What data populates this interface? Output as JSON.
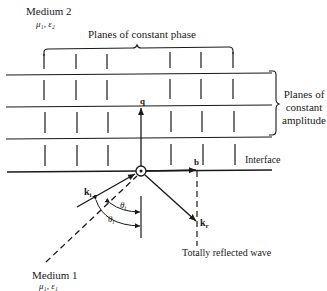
{
  "media": {
    "medium2": {
      "title": "Medium 2",
      "params": "μ₁, ε₂"
    },
    "medium1": {
      "title": "Medium 1",
      "params": "μ₁, ε₁"
    }
  },
  "labels": {
    "constant_phase": "Planes of constant phase",
    "constant_amplitude_line1": "Planes of",
    "constant_amplitude_line2": "constant",
    "constant_amplitude_line3": "amplitude",
    "interface": "Interface",
    "reflected": "Totally reflected wave"
  },
  "vectors": {
    "q": "q",
    "b": "b",
    "k_i": {
      "base": "k",
      "sub": "i"
    },
    "k_r": {
      "base": "k",
      "sub": "r"
    }
  },
  "angles": {
    "theta_t": {
      "base": "θ",
      "sub": "t"
    },
    "theta_i": {
      "base": "θ",
      "sub": "i"
    }
  },
  "colors": {
    "ink": "#1a1a1a",
    "background": "#ffffff"
  }
}
